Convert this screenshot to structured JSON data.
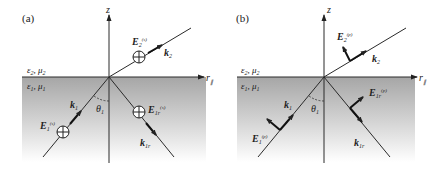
{
  "panels": [
    {
      "id": "a",
      "label": "(a)",
      "polarization": "s",
      "axis_z": "z",
      "axis_r": "r",
      "axis_r_sub": "∥",
      "medium_upper": {
        "eps": "ε",
        "eps_sub": "2",
        "mu": "μ",
        "mu_sub": "2"
      },
      "medium_lower": {
        "eps": "ε",
        "eps_sub": "1",
        "mu": "μ",
        "mu_sub": "1"
      },
      "angle": {
        "symbol": "θ",
        "sub": "1"
      },
      "k_incident": {
        "symbol": "k",
        "sub": "1"
      },
      "k_reflected": {
        "symbol": "k",
        "sub": "1r"
      },
      "k_transmitted": {
        "symbol": "k",
        "sub": "2"
      },
      "E_incident": {
        "symbol": "E",
        "sub": "1",
        "sup": "(s)"
      },
      "E_reflected": {
        "symbol": "E",
        "sub": "1r",
        "sup": "(s)"
      },
      "E_transmitted": {
        "symbol": "E",
        "sub": "2",
        "sup": "(s)"
      },
      "field_glyph": "circle-cross"
    },
    {
      "id": "b",
      "label": "(b)",
      "polarization": "p",
      "axis_z": "z",
      "axis_r": "r",
      "axis_r_sub": "∥",
      "medium_upper": {
        "eps": "ε",
        "eps_sub": "2",
        "mu": "μ",
        "mu_sub": "2"
      },
      "medium_lower": {
        "eps": "ε",
        "eps_sub": "1",
        "mu": "μ",
        "mu_sub": "1"
      },
      "angle": {
        "symbol": "θ",
        "sub": "1"
      },
      "k_incident": {
        "symbol": "k",
        "sub": "1"
      },
      "k_reflected": {
        "symbol": "k",
        "sub": "1r"
      },
      "k_transmitted": {
        "symbol": "k",
        "sub": "2"
      },
      "E_incident": {
        "symbol": "E",
        "sub": "1",
        "sup": "(p)"
      },
      "E_reflected": {
        "symbol": "E",
        "sub": "1r",
        "sup": "(p)"
      },
      "E_transmitted": {
        "symbol": "E",
        "sub": "2",
        "sup": "(p)"
      },
      "field_glyph": "in-plane-arrow"
    }
  ],
  "colors": {
    "line": "#2a2a2a",
    "medium_top": "#a8a8a8",
    "medium_bottom": "#ffffff",
    "background": "#ffffff"
  }
}
